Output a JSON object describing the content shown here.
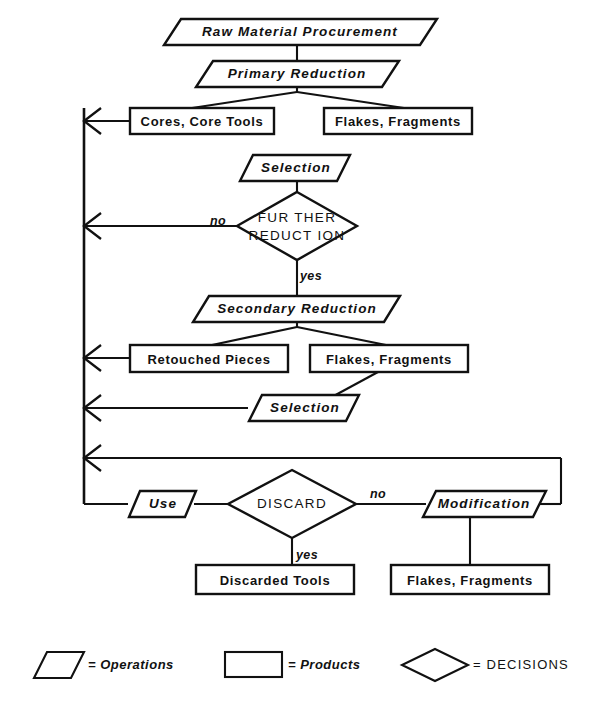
{
  "diagram": {
    "type": "flowchart",
    "nodes": {
      "raw_material_procurement": "Raw Material Procurement",
      "primary_reduction": "Primary Reduction",
      "cores_core_tools": "Cores, Core Tools",
      "flakes_fragments_top": "Flakes, Fragments",
      "selection_upper": "Selection",
      "further_reduction": "FURTHER\nREDUCTION",
      "further_reduction_line1": "FUR THER",
      "further_reduction_line2": "REDUCT ION",
      "secondary_reduction": "Secondary Reduction",
      "retouched_pieces": "Retouched  Pieces",
      "flakes_fragments_mid": "Flakes, Fragments",
      "selection_lower": "Selection",
      "use": "Use",
      "discard": "DISCARD",
      "modification": "Modification",
      "discarded_tools": "Discarded Tools",
      "flakes_fragments_bottom": "Flakes, Fragments"
    },
    "branch_labels": {
      "further_reduction_no": "no",
      "further_reduction_yes": "yes",
      "discard_no": "no",
      "discard_yes": "yes"
    },
    "legend": {
      "operations": {
        "shape": "parallelogram",
        "equals": "=",
        "label": "Operations",
        "full": "= Operations"
      },
      "products": {
        "shape": "rectangle",
        "equals": "=",
        "label": "Products",
        "full": "= Products"
      },
      "decisions": {
        "shape": "diamond",
        "equals": "=",
        "label": "DECISIONS",
        "full": "= DECISIONS"
      }
    },
    "colors": {
      "stroke": "#111111",
      "fill": "#ffffff",
      "background": "#ffffff"
    }
  }
}
